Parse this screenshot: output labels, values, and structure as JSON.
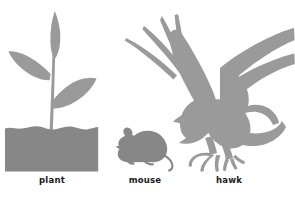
{
  "illustration": {
    "title": "Food chain organisms",
    "background_color": "#ffffff",
    "silhouette_color": "#9a9a9a",
    "soil_color": "#878787",
    "label_color": "#1a1a1a"
  },
  "organisms": [
    {
      "id": "plant",
      "label": "plant",
      "icon": "plant-silhouette",
      "parts": [
        "soil-block",
        "stem",
        "left-leaf",
        "right-leaf",
        "top-bud-leaf"
      ]
    },
    {
      "id": "mouse",
      "label": "mouse",
      "icon": "mouse-silhouette",
      "parts": [
        "head",
        "ear",
        "body",
        "legs",
        "tail"
      ]
    },
    {
      "id": "hawk",
      "label": "hawk",
      "icon": "hawk-silhouette",
      "parts": [
        "left-wing",
        "right-wing",
        "head",
        "beak",
        "body",
        "tail",
        "talons"
      ]
    }
  ]
}
